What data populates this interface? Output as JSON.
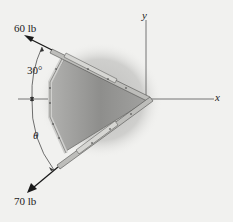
{
  "diagram": {
    "forces": [
      {
        "label": "60 lb",
        "direction": "up-left"
      },
      {
        "label": "70 lb",
        "direction": "down-left"
      }
    ],
    "angles": [
      {
        "label": "30°"
      },
      {
        "label": "θ"
      }
    ],
    "axes": {
      "x_label": "x",
      "y_label": "y"
    },
    "colors": {
      "background": "#f1f1ef",
      "plate_fill": "#8f8f8f",
      "shadow": "#c9c9c7",
      "member": "#b8b8b5",
      "arrow": "#1a1a1a"
    }
  }
}
